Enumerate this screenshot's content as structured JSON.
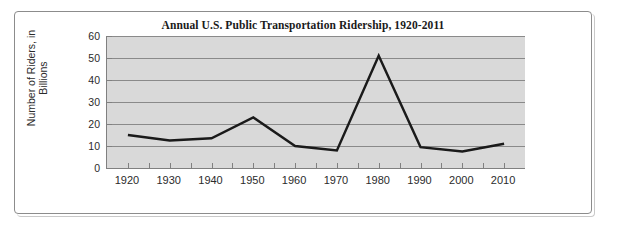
{
  "chart_data": {
    "type": "line",
    "title": "Annual U.S. Public Transportation Ridership, 1920-2011",
    "xlabel": "",
    "ylabel": "Number of Riders, in Billions",
    "ylabel_line1": "Number of Riders, in",
    "ylabel_line2": "Billions",
    "categories": [
      "1920",
      "1930",
      "1940",
      "1950",
      "1960",
      "1970",
      "1980",
      "1990",
      "2000",
      "2010"
    ],
    "x": [
      1920,
      1930,
      1940,
      1950,
      1960,
      1970,
      1980,
      1990,
      2000,
      2010
    ],
    "values": [
      15,
      12.5,
      13.5,
      23,
      10,
      8,
      51,
      9.5,
      7.5,
      11
    ],
    "ylim": [
      0,
      60
    ],
    "ytick_labels": [
      "0",
      "10",
      "20",
      "30",
      "40",
      "50",
      "60"
    ],
    "ytick_values": [
      0,
      10,
      20,
      30,
      40,
      50,
      60
    ],
    "xlim": [
      1915,
      2015
    ],
    "grid": "horizontal",
    "legend": "none",
    "series_color": "#1a1a1a",
    "plot_background": "#d9d9d9",
    "gridline_color": "#8a8a8a",
    "axis_color": "#808080",
    "minor_tick_step": 5
  }
}
